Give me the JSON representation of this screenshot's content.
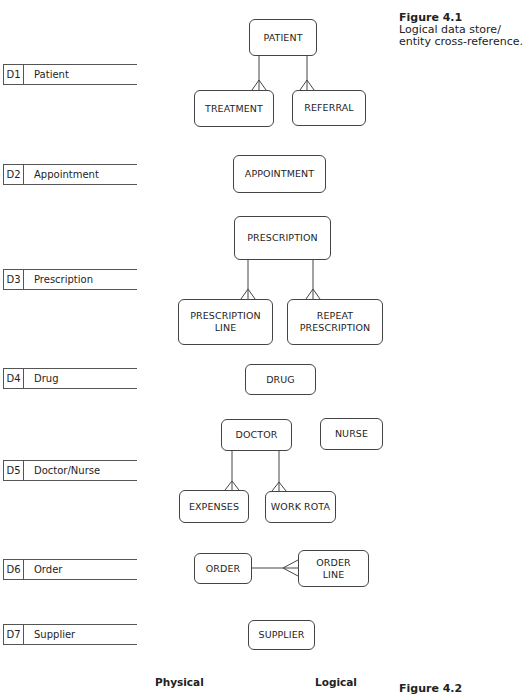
{
  "figure_4_1": {
    "title": "Figure 4.1",
    "caption_lines": [
      "Logical data store/",
      "entity cross-reference."
    ]
  },
  "data_stores": [
    {
      "id": "D1",
      "name": "Patient"
    },
    {
      "id": "D2",
      "name": "Appointment"
    },
    {
      "id": "D3",
      "name": "Prescription"
    },
    {
      "id": "D4",
      "name": "Drug"
    },
    {
      "id": "D5",
      "name": "Doctor/Nurse"
    },
    {
      "id": "D6",
      "name": "Order"
    },
    {
      "id": "D7",
      "name": "Supplier"
    }
  ],
  "entities": {
    "patient": "PATIENT",
    "treatment": "TREATMENT",
    "referral": "REFERRAL",
    "appointment": "APPOINTMENT",
    "prescription": "PRESCRIPTION",
    "prescription_line": [
      "PRESCRIPTION",
      "LINE"
    ],
    "repeat_prescription": [
      "REPEAT",
      "PRESCRIPTION"
    ],
    "drug": "DRUG",
    "doctor": "DOCTOR",
    "nurse": "NURSE",
    "expenses": "EXPENSES",
    "work_rota": "WORK ROTA",
    "order": "ORDER",
    "order_line": [
      "ORDER",
      "LINE"
    ],
    "supplier": "SUPPLIER"
  },
  "relationships": [
    {
      "from": "PATIENT",
      "to": "TREATMENT",
      "type": "one-to-many"
    },
    {
      "from": "PATIENT",
      "to": "REFERRAL",
      "type": "one-to-many"
    },
    {
      "from": "PRESCRIPTION",
      "to": "PRESCRIPTION LINE",
      "type": "one-to-many"
    },
    {
      "from": "PRESCRIPTION",
      "to": "REPEAT PRESCRIPTION",
      "type": "one-to-many"
    },
    {
      "from": "DOCTOR",
      "to": "EXPENSES",
      "type": "one-to-many"
    },
    {
      "from": "DOCTOR",
      "to": "WORK ROTA",
      "type": "one-to-many"
    },
    {
      "from": "ORDER",
      "to": "ORDER LINE",
      "type": "one-to-many"
    }
  ],
  "footer": {
    "physical_label": "Physical",
    "logical_label": "Logical",
    "figure_4_2_title": "Figure 4.2"
  }
}
